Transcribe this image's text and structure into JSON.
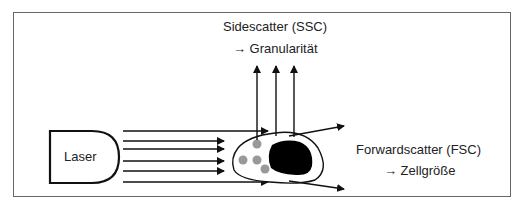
{
  "diagram": {
    "title_ssc": "Sidescatter (SSC)",
    "ssc_meaning": "→ Granularität",
    "title_fsc": "Forwardscatter (FSC)",
    "fsc_meaning": "→ Zellgröße",
    "laser_label": "Laser",
    "colors": {
      "frame": "#555555",
      "line": "#111111",
      "nucleus": "#000000",
      "granule": "#999999"
    }
  }
}
